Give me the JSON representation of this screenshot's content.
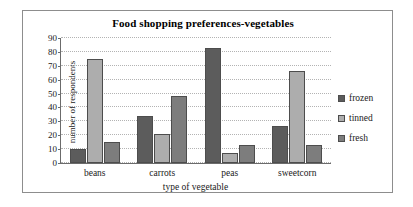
{
  "chart_data": {
    "type": "bar",
    "title": "Food shopping preferences-vegetables",
    "xlabel": "type of vegetable",
    "ylabel": "number of respondents",
    "categories": [
      "beans",
      "carrots",
      "peas",
      "sweetcorn"
    ],
    "series": [
      {
        "name": "frozen",
        "color": "#5c5c5c",
        "values": [
          10,
          34,
          83,
          27
        ]
      },
      {
        "name": "tinned",
        "color": "#adadad",
        "values": [
          75,
          21,
          7,
          66
        ]
      },
      {
        "name": "fresh",
        "color": "#7d7d7d",
        "values": [
          15,
          48,
          13,
          13
        ]
      }
    ],
    "ylim": [
      0,
      90
    ],
    "ytick_step": 10,
    "yticks": [
      0,
      10,
      20,
      30,
      40,
      50,
      60,
      70,
      80,
      90
    ],
    "grid": true,
    "legend_position": "right",
    "frame_color": "#8d8d8d",
    "gridline_color": "#b3b3b3",
    "axis_color": "#6b6b6b"
  }
}
